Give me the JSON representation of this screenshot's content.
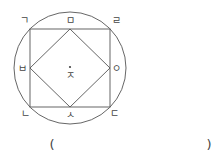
{
  "figure": {
    "circle": {
      "cx": 70,
      "cy": 68,
      "r": 56
    },
    "square": {
      "x": 30,
      "y": 29,
      "width": 80,
      "height": 78
    },
    "diamond": {
      "top": [
        70,
        29
      ],
      "right": [
        110,
        68
      ],
      "bottom": [
        70,
        107
      ],
      "left": [
        30,
        68
      ]
    },
    "center_dot": {
      "cx": 70,
      "cy": 67
    },
    "stroke_color": "#555555"
  },
  "labels": {
    "giyeok": "ㄱ",
    "mieum": "ㅁ",
    "rieul": "ㄹ",
    "bieup": "ㅂ",
    "ieung": "ㅇ",
    "jieut": "ㅈ",
    "nieun": "ㄴ",
    "siot": "ㅅ",
    "digeut": "ㄷ"
  },
  "answer": {
    "open_paren": "(",
    "close_paren": ")",
    "value": ""
  }
}
